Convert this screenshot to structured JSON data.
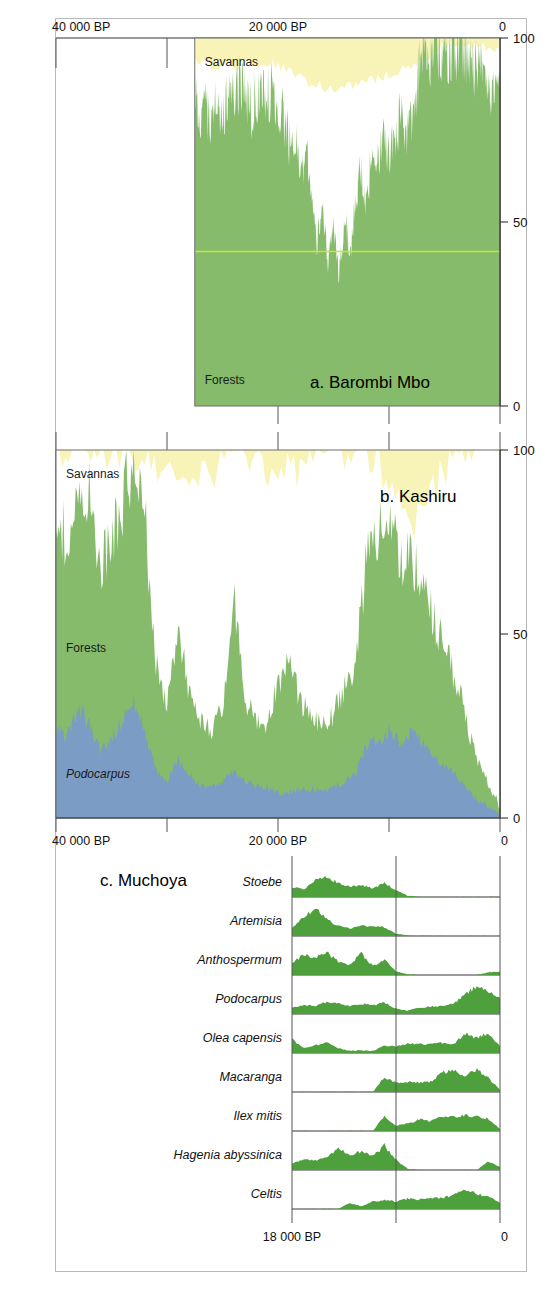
{
  "figure": {
    "background": "#ffffff",
    "border_color": "#b9b9b9",
    "colors": {
      "forest_green": "#85bb6a",
      "savanna_yellow": "#f8f4b8",
      "podocarpus_blue": "#7b9cc4",
      "muchoya_green": "#4da03c",
      "unidentified_white": "#ffffff",
      "axis": "#333333",
      "grid": "#555555"
    }
  },
  "axes": {
    "top_time_axis": {
      "ticks": [
        {
          "value": 40000,
          "label": "40 000 BP"
        },
        {
          "value": 20000,
          "label": "20 000 BP"
        },
        {
          "value": 0,
          "label": "0"
        }
      ],
      "minor_ticks": [
        30000,
        10000
      ],
      "range": [
        40000,
        0
      ],
      "unit": "BP"
    },
    "middle_time_axis": {
      "ticks": [
        {
          "value": 40000,
          "label": "40 000 BP"
        },
        {
          "value": 20000,
          "label": "20 000 BP"
        },
        {
          "value": 0,
          "label": "0"
        }
      ],
      "minor_ticks": [
        30000,
        10000
      ],
      "range": [
        40000,
        0
      ],
      "unit": "BP"
    },
    "muchoya_time_axis": {
      "ticks": [
        {
          "value": 18000,
          "label": "18 000 BP"
        },
        {
          "value": 0,
          "label": "0"
        }
      ],
      "minor_ticks": [
        9000
      ],
      "range": [
        18000,
        0
      ],
      "unit": "BP"
    },
    "percent_axis_a": {
      "ticks": [
        {
          "value": 100,
          "label": "100"
        },
        {
          "value": 50,
          "label": "50"
        },
        {
          "value": 0,
          "label": "0"
        }
      ],
      "range": [
        0,
        100
      ]
    },
    "percent_axis_b": {
      "ticks": [
        {
          "value": 100,
          "label": "100"
        },
        {
          "value": 50,
          "label": "50"
        },
        {
          "value": 0,
          "label": "0"
        }
      ],
      "range": [
        0,
        100
      ]
    }
  },
  "panel_a": {
    "title": "a. Barombi Mbo",
    "labels": {
      "savannas": "Savannas",
      "forests": "Forests"
    },
    "time_start": 27500,
    "time_end": 0
  },
  "panel_b": {
    "title": "b. Kashiru",
    "labels": {
      "savannas": "Savannas",
      "forests": "Forests",
      "podocarpus": "Podocarpus"
    },
    "time_start": 40000,
    "time_end": 0
  },
  "panel_c": {
    "title": "c. Muchoya",
    "taxa": [
      "Stoebe",
      "Artemisia",
      "Anthospermum",
      "Podocarpus",
      "Olea capensis",
      "Macaranga",
      "Ilex mitis",
      "Hagenia abyssinica",
      "Celtis"
    ]
  },
  "chart_data": [
    {
      "type": "area",
      "id": "barombi-mbo",
      "title": "a. Barombi Mbo",
      "subtitle": "Cumulative pollen percentages, Barombi Mbo (Cameroon)",
      "xlabel": "Years BP",
      "ylabel": "Percent",
      "xlim": [
        27500,
        0
      ],
      "ylim": [
        0,
        100
      ],
      "x_reversed": true,
      "grid": true,
      "stacking": "cumulative-from-bottom",
      "legend": [
        "Forests",
        "Savannas"
      ],
      "legend_position": "in-plot",
      "series": [
        {
          "name": "Forests",
          "color": "#85bb6a",
          "x": [
            27500,
            27000,
            26500,
            26000,
            25500,
            25000,
            24500,
            24000,
            23500,
            23000,
            22500,
            22000,
            21500,
            21000,
            20500,
            20000,
            19500,
            19000,
            18500,
            18000,
            17500,
            17000,
            16500,
            16000,
            15500,
            15000,
            14500,
            14000,
            13500,
            13000,
            12500,
            12000,
            11500,
            11000,
            10500,
            10000,
            9500,
            9000,
            8500,
            8000,
            7500,
            7000,
            6500,
            6000,
            5500,
            5000,
            4500,
            4000,
            3500,
            3000,
            2500,
            2000,
            1500,
            1000,
            500,
            0
          ],
          "values": [
            86,
            78,
            81,
            74,
            83,
            79,
            86,
            83,
            88,
            84,
            80,
            83,
            86,
            84,
            87,
            83,
            78,
            72,
            74,
            62,
            70,
            57,
            44,
            55,
            40,
            50,
            35,
            52,
            41,
            58,
            64,
            55,
            70,
            66,
            72,
            68,
            71,
            78,
            75,
            79,
            86,
            96,
            95,
            96,
            95,
            96,
            95,
            96,
            97,
            96,
            93,
            92,
            89,
            83,
            86,
            89
          ]
        },
        {
          "name": "Savannas",
          "color": "#f8f4b8",
          "note": "Upper yellow band; remainder to 100 is unidentified/other (white)",
          "x": [
            27500,
            25000,
            22500,
            20000,
            17500,
            15000,
            12500,
            10000,
            7500,
            5000,
            2500,
            0
          ],
          "values": [
            6,
            8,
            7,
            7,
            12,
            14,
            12,
            10,
            7,
            2,
            2,
            3
          ]
        }
      ],
      "hairline": {
        "value": 42,
        "color": "#cfe23a",
        "note": "pale horizontal marker line inside forest band"
      }
    },
    {
      "type": "area",
      "id": "kashiru",
      "title": "b. Kashiru",
      "subtitle": "Cumulative pollen percentages, Kashiru (Burundi)",
      "xlabel": "Years BP",
      "ylabel": "Percent",
      "xlim": [
        40000,
        0
      ],
      "ylim": [
        0,
        100
      ],
      "x_reversed": true,
      "grid": true,
      "stacking": "cumulative-from-bottom",
      "legend": [
        "Podocarpus",
        "Forests",
        "Savannas"
      ],
      "legend_position": "in-plot",
      "series": [
        {
          "name": "Podocarpus",
          "color": "#7b9cc4",
          "x": [
            40000,
            39000,
            38000,
            37000,
            36000,
            35000,
            34000,
            33000,
            32000,
            31000,
            30000,
            29000,
            28000,
            27000,
            26000,
            25000,
            24000,
            23000,
            22000,
            21000,
            20000,
            19000,
            18000,
            17000,
            16000,
            15000,
            14000,
            13000,
            12000,
            11000,
            10000,
            9000,
            8000,
            7000,
            6000,
            5000,
            4000,
            3000,
            2000,
            1000,
            0
          ],
          "values": [
            24,
            22,
            30,
            26,
            18,
            22,
            26,
            32,
            24,
            13,
            10,
            16,
            12,
            9,
            8,
            10,
            13,
            10,
            9,
            8,
            7,
            7,
            8,
            8,
            7,
            8,
            10,
            12,
            20,
            21,
            24,
            20,
            23,
            21,
            17,
            14,
            12,
            8,
            5,
            3,
            1
          ]
        },
        {
          "name": "Forests",
          "color": "#85bb6a",
          "x": [
            40000,
            39000,
            38000,
            37000,
            36000,
            35000,
            34000,
            33000,
            32000,
            31000,
            30000,
            29000,
            28000,
            27000,
            26000,
            25000,
            24000,
            23000,
            22000,
            21000,
            20000,
            19000,
            18000,
            17000,
            16000,
            15000,
            14000,
            13000,
            12000,
            11000,
            10000,
            9000,
            8000,
            7000,
            6000,
            5000,
            4000,
            3000,
            2000,
            1000,
            0
          ],
          "values": [
            52,
            56,
            62,
            64,
            50,
            55,
            60,
            66,
            58,
            30,
            20,
            35,
            22,
            18,
            16,
            20,
            48,
            22,
            18,
            16,
            30,
            34,
            24,
            20,
            18,
            20,
            26,
            30,
            52,
            56,
            58,
            50,
            48,
            44,
            38,
            32,
            26,
            18,
            10,
            6,
            2
          ]
        },
        {
          "name": "Savannas",
          "color": "#f8f4b8",
          "note": "Top yellow band up to 100; white gap = unidentified",
          "x": [
            40000,
            36000,
            32000,
            28000,
            24000,
            20000,
            16000,
            12000,
            8000,
            4000,
            0
          ],
          "values": [
            100,
            100,
            100,
            88,
            100,
            92,
            100,
            100,
            78,
            100,
            100
          ]
        }
      ]
    },
    {
      "type": "area",
      "id": "muchoya",
      "title": "c. Muchoya",
      "subtitle": "Individual taxon pollen curves, Muchoya Swamp (Uganda)",
      "xlabel": "Years BP",
      "ylabel": "Relative pollen abundance",
      "xlim": [
        18000,
        0
      ],
      "ylim": [
        0,
        100
      ],
      "x_reversed": true,
      "grid": true,
      "color": "#4da03c",
      "series": [
        {
          "name": "Stoebe",
          "x": [
            18000,
            17000,
            16000,
            15000,
            14000,
            13000,
            12000,
            11000,
            10000,
            9000,
            8000,
            7000,
            6000,
            5000,
            4000,
            3000,
            2000,
            1000,
            0
          ],
          "values": [
            30,
            22,
            48,
            60,
            40,
            30,
            34,
            26,
            40,
            20,
            4,
            0,
            0,
            0,
            0,
            0,
            0,
            0,
            0
          ]
        },
        {
          "name": "Artemisia",
          "x": [
            18000,
            17000,
            16000,
            15000,
            14000,
            13000,
            12000,
            11000,
            10000,
            9000,
            8000,
            7000,
            6000,
            5000,
            4000,
            3000,
            2000,
            1000,
            0
          ],
          "values": [
            24,
            56,
            80,
            50,
            30,
            22,
            30,
            28,
            26,
            6,
            2,
            0,
            0,
            0,
            0,
            0,
            0,
            0,
            0
          ]
        },
        {
          "name": "Anthospermum",
          "x": [
            18000,
            17000,
            16000,
            15000,
            14000,
            13000,
            12000,
            11000,
            10000,
            9000,
            8000,
            7000,
            6000,
            5000,
            4000,
            3000,
            2000,
            1000,
            0
          ],
          "values": [
            34,
            60,
            52,
            66,
            40,
            30,
            62,
            26,
            44,
            10,
            2,
            0,
            0,
            0,
            0,
            0,
            0,
            8,
            10
          ]
        },
        {
          "name": "Podocarpus",
          "x": [
            18000,
            17000,
            16000,
            15000,
            14000,
            13000,
            12000,
            11000,
            10000,
            9000,
            8000,
            7000,
            6000,
            5000,
            4000,
            3000,
            2000,
            1000,
            0
          ],
          "values": [
            20,
            26,
            24,
            34,
            30,
            24,
            30,
            26,
            34,
            16,
            10,
            18,
            22,
            24,
            30,
            58,
            82,
            62,
            48
          ]
        },
        {
          "name": "Olea capensis",
          "x": [
            18000,
            17000,
            16000,
            15000,
            14000,
            13000,
            12000,
            11000,
            10000,
            9000,
            8000,
            7000,
            6000,
            5000,
            4000,
            3000,
            2000,
            1000,
            0
          ],
          "values": [
            40,
            16,
            22,
            30,
            14,
            6,
            8,
            6,
            22,
            18,
            28,
            26,
            26,
            30,
            28,
            56,
            44,
            58,
            20
          ]
        },
        {
          "name": "Macaranga",
          "x": [
            18000,
            17000,
            16000,
            15000,
            14000,
            13000,
            12000,
            11000,
            10000,
            9000,
            8000,
            7000,
            6000,
            5000,
            4000,
            3000,
            2000,
            1000,
            0
          ],
          "values": [
            0,
            0,
            0,
            0,
            0,
            0,
            0,
            0,
            44,
            26,
            30,
            28,
            30,
            58,
            62,
            48,
            66,
            40,
            6
          ]
        },
        {
          "name": "Ilex mitis",
          "x": [
            18000,
            17000,
            16000,
            15000,
            14000,
            13000,
            12000,
            11000,
            10000,
            9000,
            8000,
            7000,
            6000,
            5000,
            4000,
            3000,
            2000,
            1000,
            0
          ],
          "values": [
            0,
            0,
            0,
            0,
            0,
            0,
            0,
            0,
            44,
            16,
            22,
            34,
            28,
            44,
            40,
            46,
            42,
            36,
            6
          ]
        },
        {
          "name": "Hagenia abyssinica",
          "x": [
            18000,
            17000,
            16000,
            15000,
            14000,
            13000,
            12000,
            11000,
            10000,
            9000,
            8000,
            7000,
            6000,
            5000,
            4000,
            3000,
            2000,
            1000,
            0
          ],
          "values": [
            18,
            30,
            28,
            36,
            62,
            44,
            56,
            40,
            72,
            30,
            4,
            0,
            0,
            0,
            0,
            0,
            0,
            26,
            8
          ]
        },
        {
          "name": "Celtis",
          "x": [
            18000,
            17000,
            16000,
            15000,
            14000,
            13000,
            12000,
            11000,
            10000,
            9000,
            8000,
            7000,
            6000,
            5000,
            4000,
            3000,
            2000,
            1000,
            0
          ],
          "values": [
            0,
            0,
            0,
            0,
            0,
            18,
            8,
            24,
            26,
            22,
            30,
            28,
            34,
            32,
            40,
            58,
            44,
            38,
            18
          ]
        }
      ]
    }
  ]
}
